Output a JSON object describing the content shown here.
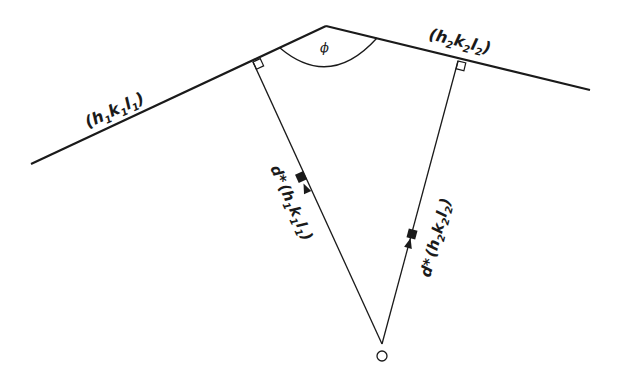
{
  "diagram": {
    "type": "reciprocal-lattice-interplanar-angle",
    "colors": {
      "ink": "#1a1a1a",
      "background": "#ffffff"
    },
    "planes": [
      {
        "id": "plane1",
        "label_parts": [
          "(h",
          "1",
          "k",
          "1",
          "l",
          "1",
          ")"
        ],
        "label": "(h1k1l1)",
        "from": [
          31,
          164
        ],
        "to": [
          326,
          26
        ]
      },
      {
        "id": "plane2",
        "label_parts": [
          "(h",
          "2",
          "k",
          "2",
          "l",
          "2",
          ")"
        ],
        "label": "(h2k2l2)",
        "from": [
          326,
          26
        ],
        "to": [
          590,
          90
        ]
      }
    ],
    "angle": {
      "symbol": "ϕ",
      "vertex": [
        326,
        26
      ]
    },
    "vectors": [
      {
        "id": "d1",
        "label_prefix": "d*",
        "label_parts": [
          "(h",
          "1",
          "k",
          "1",
          "l",
          "1",
          ")"
        ],
        "label": "d*(h1k1l1)",
        "from": [
          382,
          344
        ],
        "to": [
          253,
          62
        ]
      },
      {
        "id": "d2",
        "label_prefix": "d*",
        "label_parts": [
          "(h",
          "2",
          "k",
          "2",
          "l",
          "2",
          ")"
        ],
        "label": "d*(h2k2l2)",
        "from": [
          382,
          344
        ],
        "to": [
          458,
          61
        ]
      }
    ],
    "origin": {
      "label": "O",
      "center": [
        382,
        356
      ],
      "radius": 5
    }
  }
}
